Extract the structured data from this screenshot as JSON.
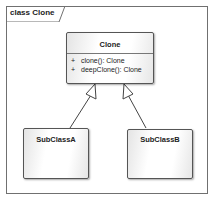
{
  "diagram": {
    "frame_label": "class Clone",
    "classes": [
      {
        "name": "Clone",
        "operations": [
          {
            "visibility": "+",
            "signature": "clone(): Clone"
          },
          {
            "visibility": "+",
            "signature": "deepClone(): Clone"
          }
        ]
      },
      {
        "name": "SubClassA",
        "operations": []
      },
      {
        "name": "SubClassB",
        "operations": []
      }
    ],
    "relationships": [
      {
        "type": "generalization",
        "from": "SubClassA",
        "to": "Clone"
      },
      {
        "type": "generalization",
        "from": "SubClassB",
        "to": "Clone"
      }
    ]
  }
}
